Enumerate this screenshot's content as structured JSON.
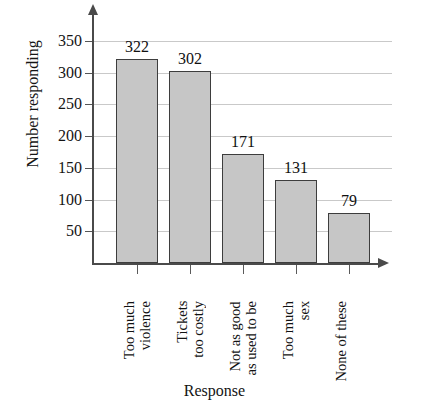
{
  "chart_data": {
    "type": "bar",
    "title": "with Movies?",
    "xlabel": "Response",
    "ylabel": "Number responding",
    "categories": [
      "Too much violence",
      "Tickets too costly",
      "Not as good as used to be",
      "Too much sex",
      "None of these"
    ],
    "category_lines": [
      [
        "Too much",
        "violence"
      ],
      [
        "Tickets",
        "too costly"
      ],
      [
        "Not as good",
        "as used to be"
      ],
      [
        "Too much",
        "sex"
      ],
      [
        "None of these"
      ]
    ],
    "values": [
      322,
      302,
      171,
      131,
      79
    ],
    "value_labels": [
      "322",
      "302",
      "171",
      "131",
      "79"
    ],
    "ylim": [
      0,
      375
    ],
    "yticks": [
      50,
      100,
      150,
      200,
      250,
      300,
      350
    ],
    "ytick_labels": [
      "50",
      "100",
      "150",
      "200",
      "250",
      "300",
      "350"
    ],
    "grid": true,
    "legend": false,
    "bar_color": "#c6c6c6",
    "bar_border_color": "#3d3d3d",
    "gridline_color": "#c9c9c9",
    "axis_color": "#4a4a4a",
    "background": "#ffffff"
  }
}
